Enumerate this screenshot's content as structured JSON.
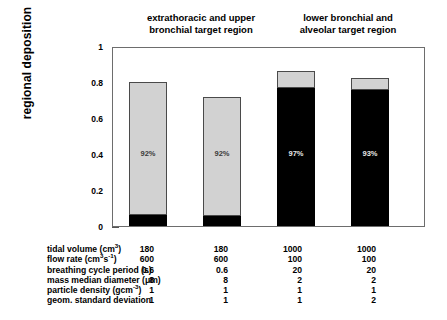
{
  "group_headers": [
    {
      "lines": [
        "extrathoracic and upper",
        "bronchial target region"
      ]
    },
    {
      "lines": [
        "lower bronchial and",
        "alveolar target region"
      ]
    }
  ],
  "axis": {
    "y_label": "regional deposition",
    "y_ticks": [
      "0",
      "0.2",
      "0.4",
      "0.6",
      "0.8",
      "1"
    ]
  },
  "bars": [
    {
      "pct_label": "92%",
      "total": 0.8,
      "lower": 0.06
    },
    {
      "pct_label": "92%",
      "total": 0.715,
      "lower": 0.055
    },
    {
      "pct_label": "97%",
      "total": 0.86,
      "lower": 0.765
    },
    {
      "pct_label": "93%",
      "total": 0.82,
      "lower": 0.755
    }
  ],
  "table": {
    "rows": [
      {
        "label_html": "tidal volume (cm<sup>3</sup>)",
        "values": [
          "180",
          "180",
          "1000",
          "1000"
        ]
      },
      {
        "label_html": "flow rate (cm<sup>3</sup>s<sup>-1</sup>)",
        "values": [
          "600",
          "600",
          "100",
          "100"
        ]
      },
      {
        "label_html": "breathing cycle period (s)",
        "values": [
          "0.6",
          "0.6",
          "20",
          "20"
        ]
      },
      {
        "label_html": "mass median diameter (&#956;m)",
        "values": [
          "8",
          "8",
          "2",
          "2"
        ]
      },
      {
        "label_html": "particle density (gcm<sup>-3</sup>)",
        "values": [
          "1",
          "1",
          "1",
          "1"
        ]
      },
      {
        "label_html": "geom. standard deviation",
        "values": [
          "1",
          "1",
          "1",
          "2"
        ]
      }
    ]
  },
  "chart_data": {
    "type": "bar",
    "title": "",
    "xlabel": "",
    "ylabel": "regional deposition",
    "ylim": [
      0,
      1
    ],
    "yticks": [
      0,
      0.2,
      0.4,
      0.6,
      0.8,
      1
    ],
    "grid": false,
    "stacked": true,
    "legend": "none",
    "group_labels": [
      "extrathoracic and upper bronchial target region",
      "lower bronchial and alveolar target region"
    ],
    "categories": [
      "case 1",
      "case 2",
      "case 3",
      "case 4"
    ],
    "series": [
      {
        "name": "lower segment (black)",
        "color": "#000000",
        "values": [
          0.06,
          0.055,
          0.765,
          0.755
        ]
      },
      {
        "name": "upper segment (light gray)",
        "color": "#d2d2d2",
        "values": [
          0.74,
          0.66,
          0.095,
          0.065
        ]
      }
    ],
    "bar_totals": [
      0.8,
      0.715,
      0.86,
      0.82
    ],
    "annotations": [
      "92%",
      "92%",
      "97%",
      "93%"
    ],
    "parameter_table": {
      "row_labels": [
        "tidal volume (cm3)",
        "flow rate (cm3s-1)",
        "breathing cycle period (s)",
        "mass median diameter (um)",
        "particle density (gcm-3)",
        "geom. standard deviation"
      ],
      "columns": [
        [
          "180",
          "600",
          "0.6",
          "8",
          "1",
          "1"
        ],
        [
          "180",
          "600",
          "0.6",
          "8",
          "1",
          "1"
        ],
        [
          "1000",
          "100",
          "20",
          "2",
          "1",
          "1"
        ],
        [
          "1000",
          "100",
          "20",
          "2",
          "1",
          "2"
        ]
      ]
    }
  }
}
